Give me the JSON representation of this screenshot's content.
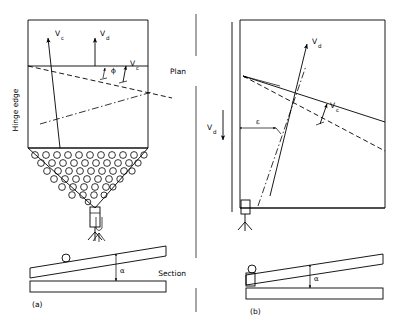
{
  "figure": {
    "title": "",
    "width": 395,
    "height": 322,
    "ink_color": "#000000",
    "background_color": "#ffffff"
  },
  "labels": {
    "hinge_edge": "Hinge edge",
    "plan": "Plan",
    "section": "Section",
    "panel_a": "(a)",
    "panel_b": "(b)",
    "vector_vc": "V",
    "vector_vc_sub": "c",
    "vector_vd": "V",
    "vector_vd_sub": "d",
    "angle_phi": "ϕ",
    "angle_epsilon": "ε",
    "angle_alpha": "α"
  },
  "panel_a": {
    "name": "(a)",
    "plan_view": {
      "description": "Rectangular plan of a vibrating screen deck with hopper discharge",
      "vectors": [
        {
          "name": "V_c",
          "label": "V",
          "subscript": "c",
          "orientation": "inclined-up-right",
          "location": "upper-left-interior"
        },
        {
          "name": "V_d",
          "label": "V",
          "subscript": "d",
          "orientation": "vertical-up",
          "location": "upper-centre"
        },
        {
          "name": "V_c",
          "label": "V",
          "subscript": "c",
          "orientation": "inclined-up-right",
          "location": "mid-right-on-dashed-line"
        }
      ],
      "angles": [
        {
          "symbol": "ϕ",
          "name": "phi",
          "between": "V_c and normal to dashed trajectory"
        }
      ],
      "lines": [
        {
          "style": "solid",
          "role": "plan-outline"
        },
        {
          "style": "solid-horizontal",
          "role": "hinge-edge-line"
        },
        {
          "style": "dashed",
          "role": "material-trajectory"
        },
        {
          "style": "dash-dot",
          "role": "centre-of-motion-axis"
        }
      ],
      "hopper": {
        "shape": "inverted-trapezoid-funnel",
        "fill": "circles",
        "circle_rows": 6,
        "outlet": "rectangular-spout"
      },
      "support": {
        "type": "pivot-leg",
        "location": "below-outlet"
      }
    },
    "section_view": {
      "description": "Side section: inclined hatched deck over horizontal hatched base",
      "angle": {
        "symbol": "α",
        "name": "alpha",
        "meaning": "deck inclination"
      },
      "members": [
        {
          "name": "inclined-deck",
          "hatch": "diagonal"
        },
        {
          "name": "base-beam",
          "hatch": "diagonal"
        }
      ],
      "supports": [
        {
          "type": "pivot-circle",
          "location": "left-of-deck"
        },
        {
          "type": "hanger-link",
          "location": "above-deck"
        }
      ]
    }
  },
  "panel_b": {
    "name": "(b)",
    "plan_view": {
      "description": "Rectangular plan with hinge line at left, fan of trajectories from hinge corner",
      "vectors": [
        {
          "name": "V_d",
          "label": "V",
          "subscript": "d",
          "orientation": "inclined-up-right",
          "location": "interior-centre"
        },
        {
          "name": "V_d",
          "label": "V",
          "subscript": "d",
          "orientation": "vertical-down",
          "location": "outside-left"
        },
        {
          "name": "V_c",
          "label": "V",
          "subscript": "c",
          "orientation": "inclined-up-right",
          "location": "mid-interior-on-dashed-line"
        }
      ],
      "angles": [
        {
          "symbol": "ε",
          "name": "epsilon",
          "between": "hinge line and trajectory"
        }
      ],
      "lines": [
        {
          "style": "solid",
          "role": "plan-outline"
        },
        {
          "style": "solid",
          "role": "upper-trajectory-from-hinge"
        },
        {
          "style": "dashed",
          "role": "lower-trajectory-from-hinge"
        },
        {
          "style": "solid",
          "role": "vector-line-Vd"
        },
        {
          "style": "dash-dot",
          "role": "centre-of-motion-axis"
        },
        {
          "style": "double-vertical",
          "role": "hinge-edge-at-left"
        }
      ],
      "support": {
        "type": "pivot-leg",
        "location": "bottom-left-at-hinge"
      }
    },
    "section_view": {
      "description": "Side section: inclined hatched deck over horizontal hatched base, hinge at left",
      "angle": {
        "symbol": "α",
        "name": "alpha",
        "meaning": "deck inclination"
      },
      "members": [
        {
          "name": "inclined-deck",
          "hatch": "diagonal"
        },
        {
          "name": "base-beam",
          "hatch": "diagonal"
        }
      ],
      "supports": [
        {
          "type": "pivot-circle",
          "location": "left-end-of-deck"
        },
        {
          "type": "hinge-bracket",
          "hatch": "diagonal",
          "location": "left-end"
        }
      ]
    }
  },
  "divider": {
    "orientation": "vertical",
    "style": "solid",
    "role": "separates panel (a) from panel (b)"
  }
}
